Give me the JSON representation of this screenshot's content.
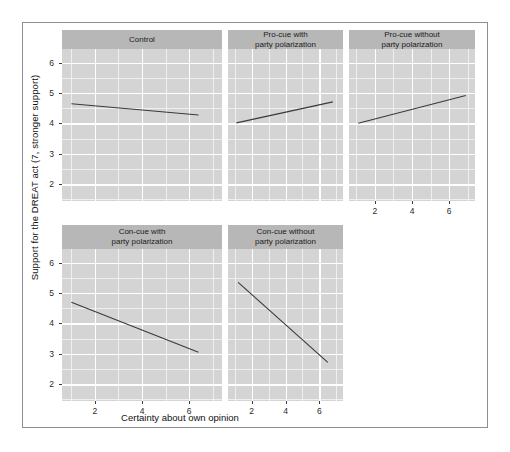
{
  "figure": {
    "x_axis_title": "Certainty about own opinion",
    "y_axis_title": "Support for the DREAT act (7, stronger support)",
    "panel_fill": "#d4d4d4",
    "strip_fill": "#b7b7b7",
    "grid_color": "#ffffff",
    "line_color": "#3a3a3a",
    "frame_color": "#8d8d96"
  },
  "chart_data": {
    "type": "line",
    "title": "",
    "subtitle": "",
    "xlabel": "Certainty about own opinion",
    "ylabel": "Support for the DREAT act (7, stronger support)",
    "xlim": [
      0.6,
      7.4
    ],
    "ylim": [
      1.45,
      6.45
    ],
    "x_ticks": [
      2,
      4,
      6
    ],
    "y_ticks": [
      2,
      3,
      4,
      5,
      6
    ],
    "grid": true,
    "minor_grid": true,
    "legend": "none",
    "facet_layout": {
      "rows": 2,
      "cols": 3,
      "free_x_axis_bottom_only": true
    },
    "panels": [
      {
        "id": "control",
        "title": "Control",
        "title_lines": [
          "Control"
        ],
        "row": 1,
        "col": 1,
        "x": [
          1.0,
          6.4
        ],
        "y": [
          4.65,
          4.28
        ],
        "slope": "negative",
        "x_axis_shown": false
      },
      {
        "id": "pro-cue-with-party-polarization",
        "title": "Pro-cue with party polarization",
        "title_lines": [
          "Pro-cue with",
          "party polarization"
        ],
        "row": 1,
        "col": 2,
        "x": [
          1.1,
          6.8
        ],
        "y": [
          4.02,
          4.71
        ],
        "slope": "positive",
        "x_axis_shown": false
      },
      {
        "id": "pro-cue-without-party-polarization",
        "title": "Pro-cue without party polarization",
        "title_lines": [
          "Pro-cue without",
          "party polarization"
        ],
        "row": 1,
        "col": 3,
        "x": [
          1.1,
          6.9
        ],
        "y": [
          4.01,
          4.92
        ],
        "slope": "positive",
        "x_axis_shown": true
      },
      {
        "id": "con-cue-with-party-polarization",
        "title": "Con-cue with party polarization",
        "title_lines": [
          "Con-cue with",
          "party polarization"
        ],
        "row": 2,
        "col": 1,
        "x": [
          1.0,
          6.4
        ],
        "y": [
          4.7,
          3.05
        ],
        "slope": "negative",
        "x_axis_shown": true
      },
      {
        "id": "con-cue-without-party-polarization",
        "title": "Con-cue without party polarization",
        "title_lines": [
          "Con-cue without",
          "party polarization"
        ],
        "row": 2,
        "col": 2,
        "x": [
          1.2,
          6.5
        ],
        "y": [
          5.35,
          2.72
        ],
        "slope": "negative",
        "x_axis_shown": true
      }
    ]
  },
  "axes": {
    "y_tick_labels": [
      "6",
      "5",
      "4",
      "3",
      "2"
    ],
    "x_tick_labels": [
      "2",
      "4",
      "6"
    ]
  }
}
